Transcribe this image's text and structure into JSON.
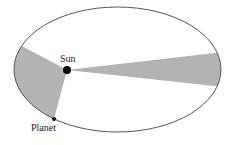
{
  "diagram": {
    "labels": {
      "sun": "Sun",
      "planet": "Planet"
    },
    "colors": {
      "orbit": "#555555",
      "sector_fill": "#b3b3b3",
      "body": "#000000"
    }
  }
}
